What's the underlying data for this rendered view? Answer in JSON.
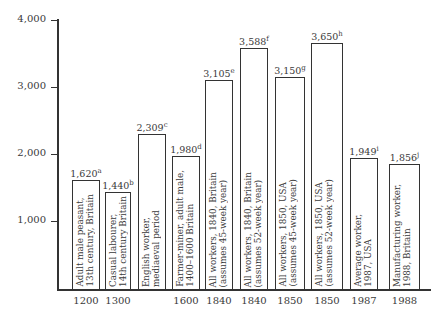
{
  "chart_data": {
    "type": "bar",
    "title": "",
    "xlabel": "",
    "ylabel": "",
    "ylim": [
      0,
      4000
    ],
    "yticks": [
      "1,000",
      "2,000",
      "3,000",
      "4,000"
    ],
    "grid": false,
    "categories": [
      "1200",
      "1300",
      "",
      "1600",
      "1840",
      "1840",
      "1850",
      "1850",
      "1987",
      "1988"
    ],
    "values": [
      1620,
      1440,
      2309,
      1980,
      3105,
      3588,
      3150,
      3650,
      1949,
      1856
    ],
    "value_labels": [
      "1,620",
      "1,440",
      "2,309",
      "1,980",
      "3,105",
      "3,588",
      "3,150",
      "3,650",
      "1,949",
      "1,856"
    ],
    "footnotes": [
      "a",
      "b",
      "c",
      "d",
      "e",
      "f",
      "g",
      "h",
      "i",
      "j"
    ],
    "descriptions": [
      "Adult male peasant,\n13th century, Britain",
      "Casual labourer,\n14th century Britain",
      "English worker,\nmediaeval period",
      "Farmer-miner, adult male,\n1400–1600 Britain",
      "All workers, 1840, Britain\n(assumes 45-week year)",
      "All workers, 1840, Britain\n(assumes 52-week year)",
      "All workers, 1850, USA\n(assumes 45-week year)",
      "All workers, 1850, USA\n(assumes 52-week year)",
      "Average worker,\n1987, USA",
      "Manufacturing worker,\n1988, Britain"
    ]
  },
  "bars": [
    {
      "value": "1,620",
      "note": "a",
      "desc": "Adult male peasant,\n13th century, Britain",
      "year": "1200"
    },
    {
      "value": "1,440",
      "note": "b",
      "desc": "Casual labourer,\n14th century Britain",
      "year": "1300"
    },
    {
      "value": "2,309",
      "note": "c",
      "desc": "English worker,\nmediaeval period",
      "year": ""
    },
    {
      "value": "1,980",
      "note": "d",
      "desc": "Farmer-miner, adult male,\n1400–1600 Britain",
      "year": "1600"
    },
    {
      "value": "3,105",
      "note": "e",
      "desc": "All workers, 1840, Britain\n(assumes 45-week year)",
      "year": "1840"
    },
    {
      "value": "3,588",
      "note": "f",
      "desc": "All workers, 1840, Britain\n(assumes 52-week year)",
      "year": "1840"
    },
    {
      "value": "3,150",
      "note": "g",
      "desc": "All workers, 1850, USA\n(assumes 45-week year)",
      "year": "1850"
    },
    {
      "value": "3,650",
      "note": "h",
      "desc": "All workers, 1850, USA\n(assumes 52-week year)",
      "year": "1850"
    },
    {
      "value": "1,949",
      "note": "i",
      "desc": "Average worker,\n1987, USA",
      "year": "1987"
    },
    {
      "value": "1,856",
      "note": "j",
      "desc": "Manufacturing worker,\n1988, Britain",
      "year": "1988"
    }
  ],
  "yaxis": {
    "ticks": [
      "4,000",
      "3,000",
      "2,000",
      "1,000"
    ]
  }
}
